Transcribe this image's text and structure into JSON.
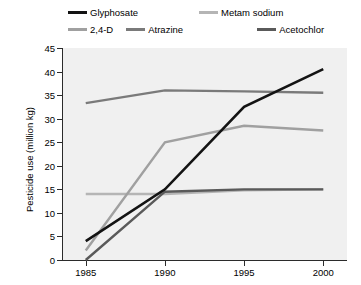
{
  "chart_data": {
    "type": "line",
    "title": "",
    "xlabel": "",
    "ylabel": "Pesticide use (million kg)",
    "x": [
      1985,
      1990,
      1995,
      2000
    ],
    "xtick_labels": [
      "1985",
      "1990",
      "1995",
      "2000"
    ],
    "ytick_labels": [
      "0",
      "5",
      "10",
      "15",
      "20",
      "25",
      "30",
      "35",
      "40",
      "45"
    ],
    "yticks": [
      0,
      5,
      10,
      15,
      20,
      25,
      30,
      35,
      40,
      45
    ],
    "ylim": [
      0,
      45
    ],
    "xlim": [
      1983.5,
      2001.5
    ],
    "grid": false,
    "legend_position": "top",
    "series": [
      {
        "name": "Glyphosate",
        "color": "#131313",
        "values": [
          4.0,
          15.0,
          32.5,
          40.5
        ]
      },
      {
        "name": "Metam sodium",
        "color": "#b5b5b5",
        "values": [
          14.0,
          14.0,
          14.8,
          15.0
        ]
      },
      {
        "name": "2,4-D",
        "color": "#a0a0a0",
        "values": [
          2.0,
          25.0,
          28.5,
          27.5
        ]
      },
      {
        "name": "Atrazine",
        "color": "#7a7a7a",
        "values": [
          33.3,
          36.0,
          35.8,
          35.5
        ]
      },
      {
        "name": "Acetochlor",
        "color": "#5a5a5a",
        "values": [
          0.0,
          14.5,
          15.0,
          15.0
        ]
      }
    ]
  },
  "legend": {
    "items": [
      {
        "label": "Glyphosate",
        "color": "#131313"
      },
      {
        "label": "Metam sodium",
        "color": "#b5b5b5"
      },
      {
        "label": "2,4-D",
        "color": "#a0a0a0"
      },
      {
        "label": "Atrazine",
        "color": "#7a7a7a"
      },
      {
        "label": "Acetochlor",
        "color": "#5a5a5a"
      }
    ]
  },
  "axes": {
    "y_title": "Pesticide use (million kg)"
  },
  "colors": {
    "plot_background": "#f0f0f0",
    "axis": "#2b2b2b",
    "page_background": "#ffffff"
  }
}
